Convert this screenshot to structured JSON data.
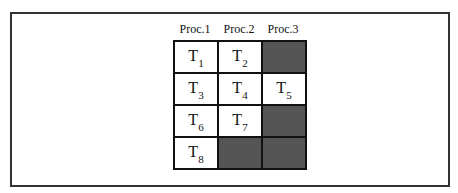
{
  "columns": [
    {
      "label": "Proc.1",
      "left": 173
    },
    {
      "label": "Proc.2",
      "left": 217
    },
    {
      "label": "Proc.3",
      "left": 261
    }
  ],
  "cells": [
    {
      "task": "T",
      "sub": "1",
      "shaded": false
    },
    {
      "task": "T",
      "sub": "2",
      "shaded": false
    },
    {
      "task": "",
      "sub": "",
      "shaded": true
    },
    {
      "task": "T",
      "sub": "3",
      "shaded": false
    },
    {
      "task": "T",
      "sub": "4",
      "shaded": false
    },
    {
      "task": "T",
      "sub": "5",
      "shaded": false
    },
    {
      "task": "T",
      "sub": "6",
      "shaded": false
    },
    {
      "task": "T",
      "sub": "7",
      "shaded": false
    },
    {
      "task": "",
      "sub": "",
      "shaded": true
    },
    {
      "task": "T",
      "sub": "8",
      "shaded": false
    },
    {
      "task": "",
      "sub": "",
      "shaded": true
    },
    {
      "task": "",
      "sub": "",
      "shaded": true
    }
  ],
  "colors": {
    "shade": "#555555",
    "border": "#111111",
    "frame": "#333333"
  }
}
